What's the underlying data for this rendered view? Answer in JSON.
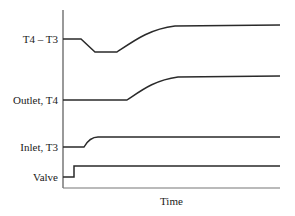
{
  "diagram": {
    "x_axis_label": "Time",
    "signals": [
      {
        "label": "T4 – T3"
      },
      {
        "label": "Outlet, T4"
      },
      {
        "label": "Inlet, T3"
      },
      {
        "label": "Valve"
      }
    ],
    "colors": {
      "line": "#2a2a2a",
      "axis": "#555555",
      "text": "#1a1a1a"
    }
  }
}
